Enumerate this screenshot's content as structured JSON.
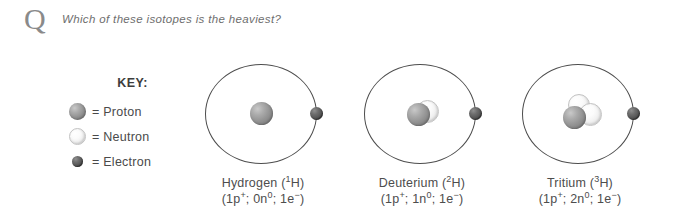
{
  "question": {
    "marker": "Q",
    "text": "Which of these isotopes is the heaviest?"
  },
  "key": {
    "title": "KEY:",
    "items": [
      {
        "swatch": "proton-sphere",
        "label": "= Proton"
      },
      {
        "swatch": "neutron-sphere",
        "label": "= Neutron"
      },
      {
        "swatch": "electron-sphere",
        "label": "= Electron"
      }
    ]
  },
  "atoms": [
    {
      "id": "hydrogen",
      "name": "Hydrogen (",
      "mass_number": "1",
      "name_suffix": "H)",
      "composition_prefix": "(1p",
      "composition": "1p+; 0n0; 1e-",
      "protons": 1,
      "neutrons": 0,
      "electrons": 1,
      "comp_parts": {
        "p_count": "(1p",
        "p_charge": "+",
        "p_sep": "; ",
        "n_count": "0n",
        "n_charge": "0",
        "n_sep": "; ",
        "e_count": "1e",
        "e_charge": "−",
        "e_end": ")"
      }
    },
    {
      "id": "deuterium",
      "name": "Deuterium (",
      "mass_number": "2",
      "name_suffix": "H)",
      "composition_prefix": "(1p",
      "composition": "1p+; 1n0; 1e-",
      "protons": 1,
      "neutrons": 1,
      "electrons": 1,
      "comp_parts": {
        "p_count": "(1p",
        "p_charge": "+",
        "p_sep": "; ",
        "n_count": "1n",
        "n_charge": "0",
        "n_sep": "; ",
        "e_count": "1e",
        "e_charge": "−",
        "e_end": ")"
      }
    },
    {
      "id": "tritium",
      "name": "Tritium (",
      "mass_number": "3",
      "name_suffix": "H)",
      "composition_prefix": "(1p",
      "composition": "1p+; 2n0; 1e-",
      "protons": 1,
      "neutrons": 2,
      "electrons": 1,
      "comp_parts": {
        "p_count": "(1p",
        "p_charge": "+",
        "p_sep": "; ",
        "n_count": "2n",
        "n_charge": "0",
        "n_sep": "; ",
        "e_count": "1e",
        "e_charge": "−",
        "e_end": ")"
      }
    }
  ],
  "colors": {
    "background": "#ffffff",
    "proton": "#939393",
    "neutron": "#f2f2f2",
    "electron": "#555555",
    "orbit_stroke": "#4d4d4d",
    "text": "#4d4d4d",
    "question_text": "#6e6e6e",
    "marker": "#8a8a8a"
  }
}
